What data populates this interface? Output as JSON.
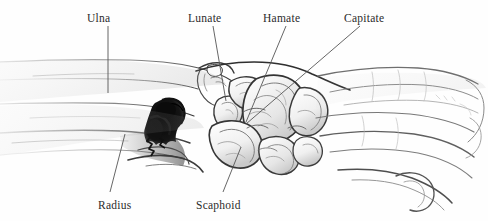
{
  "figure": {
    "type": "anatomical-illustration",
    "width": 488,
    "height": 221,
    "background_color": "#fefefe",
    "ink_color": "#2b2b2b",
    "leader_line_color": "#555555"
  },
  "labels": [
    {
      "id": "ulna",
      "text": "Ulna",
      "text_x": 87,
      "text_y": 13,
      "leader": {
        "x1": 108,
        "y1": 26,
        "x2": 108,
        "y2": 93
      }
    },
    {
      "id": "lunate",
      "text": "Lunate",
      "text_x": 188,
      "text_y": 13,
      "leader": {
        "x1": 213,
        "y1": 26,
        "x2": 226,
        "y2": 101
      }
    },
    {
      "id": "hamate",
      "text": "Hamate",
      "text_x": 263,
      "text_y": 13,
      "leader": {
        "x1": 286,
        "y1": 26,
        "x2": 246,
        "y2": 122
      }
    },
    {
      "id": "capitate",
      "text": "Capitate",
      "text_x": 344,
      "text_y": 13,
      "leader": {
        "x1": 360,
        "y1": 26,
        "x2": 246,
        "y2": 124
      }
    },
    {
      "id": "radius",
      "text": "Radius",
      "text_x": 98,
      "text_y": 200,
      "leader": {
        "x1": 125,
        "y1": 134,
        "x2": 110,
        "y2": 192
      }
    },
    {
      "id": "scaphoid",
      "text": "Scaphoid",
      "text_x": 196,
      "text_y": 200,
      "leader": {
        "x1": 241,
        "y1": 147,
        "x2": 223,
        "y2": 192
      }
    }
  ],
  "anatomy_parts": [
    {
      "id": "ulna-shaft",
      "name": "Ulna shaft"
    },
    {
      "id": "radius-shaft",
      "name": "Radius shaft"
    },
    {
      "id": "carpal-cluster",
      "name": "Carpal bones cluster"
    },
    {
      "id": "lunate-bone",
      "name": "Lunate"
    },
    {
      "id": "scaphoid-bone",
      "name": "Scaphoid"
    },
    {
      "id": "capitate-bone",
      "name": "Capitate"
    },
    {
      "id": "hamate-bone",
      "name": "Hamate"
    },
    {
      "id": "metacarpals",
      "name": "Metacarpal bones"
    },
    {
      "id": "shadow-mass",
      "name": "Dark ink shadow mass at distal radius"
    }
  ]
}
